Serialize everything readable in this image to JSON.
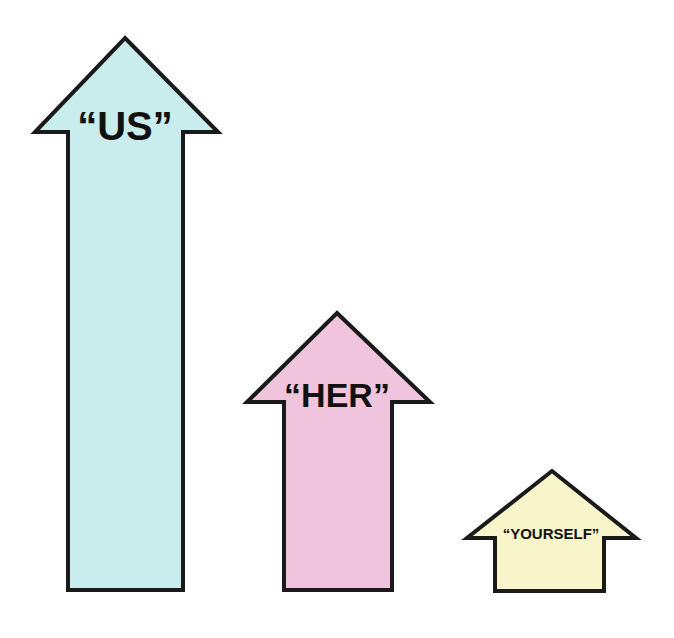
{
  "arrows": [
    {
      "label": "“US”",
      "color": "#c9ecec",
      "height": "tall"
    },
    {
      "label": "“HER”",
      "color": "#f0c4dc",
      "height": "medium"
    },
    {
      "label": "“YOURSELF”",
      "color": "#f7f5c9",
      "height": "short"
    }
  ]
}
